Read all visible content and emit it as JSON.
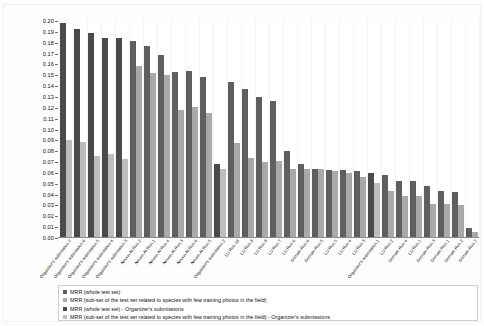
{
  "chart_data": {
    "type": "bar",
    "title": "",
    "xlabel": "",
    "ylabel": "",
    "ylim": [
      0.0,
      0.2
    ],
    "ytick_labels": [
      "0.20",
      "0.19",
      "0.18",
      "0.17",
      "0.16",
      "0.15",
      "0.14",
      "0.13",
      "0.12",
      "0.11",
      "0.10",
      "0.09",
      "0.08",
      "0.07",
      "0.06",
      "0.05",
      "0.04",
      "0.03",
      "0.02",
      "0.01",
      "0.00"
    ],
    "ytick_values": [
      0.2,
      0.19,
      0.18,
      0.17,
      0.16,
      0.15,
      0.14,
      0.13,
      0.12,
      0.11,
      0.1,
      0.09,
      0.08,
      0.07,
      0.06,
      0.05,
      0.04,
      0.03,
      0.02,
      0.01,
      0.0
    ],
    "grid": "vertical",
    "legend_position": "bottom",
    "legend": [
      {
        "label": "MRR (whole test set)",
        "color": "#5f5f5f"
      },
      {
        "label": "MRR (sub-set of the test set related to species with few training photos in the field)",
        "color": "#a9a9a9"
      },
      {
        "label": "MRR (whole test set) - Organizer's submissions",
        "color": "#4a4a4a"
      },
      {
        "label": "MRR (sub-set of the test set related to species with few training photos in the field) - Organizer's submissions",
        "color": "#bdbdbd"
      }
    ],
    "categories": [
      "Organizer's submission 7",
      "Organizer's submission 6",
      "Organizer's submission 5",
      "Organizer's submission 4",
      "Organizer's submission 3",
      "Neuon AI Run 2",
      "Neuon AI Run 1",
      "Neuon AI Run 4",
      "Neuon AI Run 3",
      "Neuon AI Run 6",
      "Neuon AI Run 5",
      "Organizer's submission 2",
      "LU Run 10",
      "LU Run 9",
      "LU Run 8",
      "LU Run 7",
      "LU Run 6",
      "Domain Run 6",
      "Domain Run 5",
      "LU Run 5",
      "LU Run 4",
      "LU Run 3",
      "Organizer's submission 1",
      "LU Run 2",
      "Domain Run 4",
      "LU Run 1",
      "Domain Run 3",
      "Domain Run 1",
      "Domain Run 2",
      "Domain Run 7"
    ],
    "series": [
      {
        "name": "MRR (whole test set)",
        "color": "#5f5f5f",
        "values": [
          null,
          null,
          null,
          null,
          null,
          0.1815,
          0.1772,
          0.1688,
          0.153,
          0.1535,
          0.1485,
          null,
          0.1438,
          0.137,
          0.13,
          0.126,
          0.08,
          0.068,
          0.064,
          0.063,
          0.0625,
          0.062,
          null,
          0.058,
          0.053,
          0.0525,
          0.048,
          0.043,
          0.042,
          0.0095
        ]
      },
      {
        "name": "MRR (sub-set of the test set related to species with few training photos in the field)",
        "color": "#a9a9a9",
        "values": [
          null,
          null,
          null,
          null,
          null,
          0.1585,
          0.152,
          0.1505,
          0.118,
          0.121,
          0.1155,
          null,
          0.0875,
          0.074,
          0.07,
          0.071,
          0.064,
          0.064,
          0.0635,
          0.062,
          0.06,
          0.056,
          null,
          0.043,
          0.039,
          0.039,
          0.031,
          0.031,
          0.03,
          0.006
        ]
      },
      {
        "name": "MRR (whole test set) - Organizer's submissions",
        "color": "#4a4a4a",
        "values": [
          0.198,
          0.1925,
          0.1885,
          0.1845,
          0.184,
          null,
          null,
          null,
          null,
          null,
          null,
          0.068,
          null,
          null,
          null,
          null,
          null,
          null,
          null,
          null,
          null,
          null,
          0.06,
          null,
          null,
          null,
          null,
          null,
          null,
          null
        ]
      },
      {
        "name": "MRR (sub-set of the test set related to species with few training photos in the field) - Organizer's submissions",
        "color": "#bdbdbd",
        "values": [
          0.09,
          0.0885,
          0.076,
          0.0775,
          0.073,
          null,
          null,
          null,
          null,
          null,
          null,
          0.064,
          null,
          null,
          null,
          null,
          null,
          null,
          null,
          null,
          null,
          null,
          0.0505,
          null,
          null,
          null,
          null,
          null,
          null,
          null
        ]
      }
    ]
  }
}
